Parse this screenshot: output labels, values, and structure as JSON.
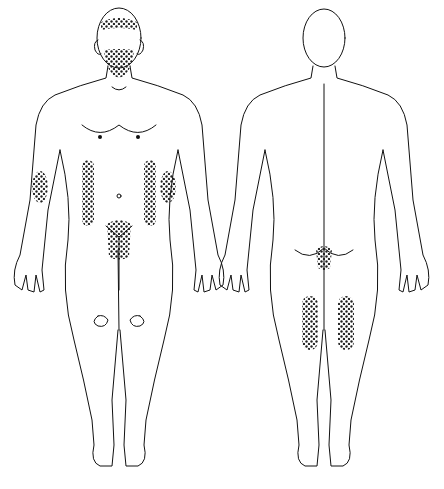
{
  "figure": {
    "views": [
      {
        "id": "front",
        "label": "Anterior view"
      },
      {
        "id": "back",
        "label": "Posterior view"
      }
    ],
    "shaded_regions": {
      "front": [
        "scalp",
        "beard-chin",
        "left-axilla-flank",
        "right-axilla-flank",
        "left-forearm",
        "right-forearm",
        "pubic"
      ],
      "back": [
        "gluteal-cleft",
        "left-posterior-thigh",
        "right-posterior-thigh"
      ]
    },
    "pattern": "dotted",
    "colors": {
      "line": "#111111",
      "dots": "#222222",
      "background": "#ffffff"
    }
  },
  "caption": {
    "text": ""
  }
}
